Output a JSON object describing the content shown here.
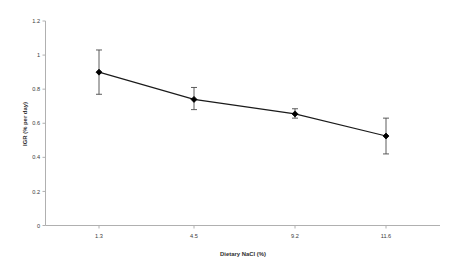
{
  "chart_data": {
    "type": "line",
    "title": "",
    "xlabel": "Dietary NaCl (%)",
    "ylabel": "IGR (% per day)",
    "categories": [
      "1.3",
      "4.5",
      "9.2",
      "11.6"
    ],
    "values": [
      0.9,
      0.74,
      0.655,
      0.525
    ],
    "error_low": [
      0.77,
      0.68,
      0.63,
      0.42
    ],
    "error_high": [
      1.03,
      0.81,
      0.685,
      0.63
    ],
    "series": [
      {
        "name": "IGR",
        "values": [
          0.9,
          0.74,
          0.655,
          0.525
        ]
      }
    ],
    "ylim": [
      0,
      1.2
    ],
    "ytick_labels": [
      "1.2",
      "1",
      "0.8",
      "0.6",
      "0.4",
      "0.2",
      "0"
    ],
    "ytick_values": [
      1.2,
      1.0,
      0.8,
      0.6,
      0.4,
      0.2,
      0
    ],
    "xtick_labels": [
      "1.3",
      "4.5",
      "9.2",
      "11.6"
    ],
    "grid": false,
    "legend": "none",
    "marker": "filled-diamond",
    "line_color": "#1a1a1a",
    "marker_color": "#000000",
    "error_bar_color": "#4a4a4a",
    "axis_color": "#a8a8a8",
    "background_color": "#ffffff"
  },
  "axes": {
    "y_axis_title": "IGR (% per day)",
    "x_axis_title": "Dietary NaCl (%)"
  }
}
